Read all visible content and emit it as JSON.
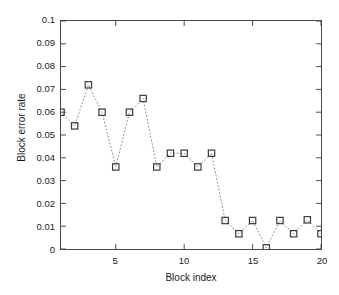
{
  "chart_data": {
    "type": "scatter",
    "title": "",
    "xlabel": "Block index",
    "ylabel": "Block error rate",
    "xlim": [
      1,
      20
    ],
    "ylim": [
      0,
      0.1
    ],
    "xticks": [
      5,
      10,
      15,
      20
    ],
    "xtick_labels": [
      "5",
      "10",
      "15",
      "20"
    ],
    "yticks": [
      0,
      0.01,
      0.02,
      0.03,
      0.04,
      0.05,
      0.06,
      0.07,
      0.08,
      0.09,
      0.1
    ],
    "ytick_labels": [
      "0",
      "0.01",
      "0.02",
      "0.03",
      "0.04",
      "0.05",
      "0.06",
      "0.07",
      "0.08",
      "0.09",
      "0.1"
    ],
    "grid": false,
    "legend": "none",
    "marker": "square-open",
    "line_style": "dotted",
    "marker_color": "#3a3a3a",
    "line_color": "#8a8a8a",
    "axis_color": "#4a4a4a",
    "x": [
      1,
      2,
      3,
      4,
      5,
      6,
      7,
      8,
      9,
      10,
      11,
      12,
      13,
      14,
      15,
      16,
      17,
      18,
      19,
      20
    ],
    "values": [
      0.06,
      0.054,
      0.072,
      0.06,
      0.036,
      0.06,
      0.066,
      0.036,
      0.042,
      0.042,
      0.036,
      0.042,
      0.0125,
      0.0067,
      0.0125,
      0.0005,
      0.0125,
      0.0067,
      0.0128,
      0.0067
    ],
    "series": [
      {
        "name": "Block error rate",
        "values": [
          0.06,
          0.054,
          0.072,
          0.06,
          0.036,
          0.06,
          0.066,
          0.036,
          0.042,
          0.042,
          0.036,
          0.042,
          0.0125,
          0.0067,
          0.0125,
          0.0005,
          0.0125,
          0.0067,
          0.0128,
          0.0067
        ]
      }
    ]
  }
}
